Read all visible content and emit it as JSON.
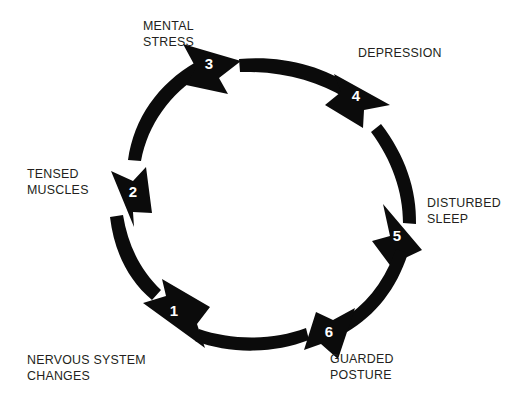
{
  "diagram": {
    "type": "cycle",
    "orientation": "clockwise",
    "background_color": "#ffffff",
    "arrow_color": "#0b0b0b",
    "number_color": "#ffffff",
    "label_color": "#231f20",
    "step_count": 6,
    "steps": [
      {
        "number": "1",
        "label": "NERVOUS SYSTEM\nCHANGES",
        "label_lines": [
          "NERVOUS SYSTEM",
          "CHANGES"
        ],
        "position": "bottom-left",
        "arrow_direction": "up-left"
      },
      {
        "number": "2",
        "label": "TENSED\nMUSCLES",
        "label_lines": [
          "TENSED",
          "MUSCLES"
        ],
        "position": "left",
        "arrow_direction": "up"
      },
      {
        "number": "3",
        "label": "MENTAL\nSTRESS",
        "label_lines": [
          "MENTAL",
          "STRESS"
        ],
        "position": "top-left",
        "arrow_direction": "up-right"
      },
      {
        "number": "4",
        "label": "DEPRESSION",
        "label_lines": [
          "DEPRESSION"
        ],
        "position": "top-right",
        "arrow_direction": "down-right"
      },
      {
        "number": "5",
        "label": "DISTURBED\nSLEEP",
        "label_lines": [
          "DISTURBED",
          "SLEEP"
        ],
        "position": "right",
        "arrow_direction": "down"
      },
      {
        "number": "6",
        "label": "GUARDED\nPOSTURE",
        "label_lines": [
          "GUARDED",
          "POSTURE"
        ],
        "position": "bottom-right",
        "arrow_direction": "down-left"
      }
    ]
  }
}
